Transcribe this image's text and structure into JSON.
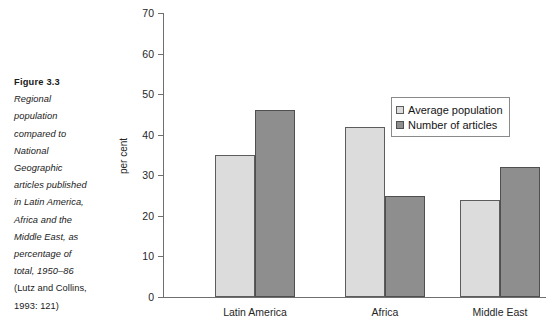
{
  "caption": {
    "title": "Figure 3.3",
    "lines": [
      {
        "text": "Regional",
        "italic": true
      },
      {
        "text": "population",
        "italic": true
      },
      {
        "text": "compared to",
        "italic": true
      },
      {
        "text": "National",
        "italic": true
      },
      {
        "text": "Geographic",
        "italic": true
      },
      {
        "text": "articles published",
        "italic": true
      },
      {
        "text": "in Latin America,",
        "italic": true
      },
      {
        "text": "Africa and the",
        "italic": true
      },
      {
        "text": "Middle East, as",
        "italic": true
      },
      {
        "text": "percentage of",
        "italic": true
      },
      {
        "text": "total, 1950–86",
        "italic": true
      },
      {
        "text": "(Lutz and Collins,",
        "italic": false
      },
      {
        "text": "1993: 121)",
        "italic": false
      }
    ]
  },
  "chart_data": {
    "type": "bar",
    "title": "",
    "xlabel": "",
    "ylabel": "per cent",
    "ylim": [
      0,
      70
    ],
    "ytick_step": 10,
    "yticks": [
      0,
      10,
      20,
      30,
      40,
      50,
      60,
      70
    ],
    "grid": false,
    "legend_position": "upper-right-inside",
    "categories": [
      "Latin America",
      "Africa",
      "Middle East"
    ],
    "series": [
      {
        "name": "Average population",
        "color": "#dcdcdc",
        "values": [
          35,
          42,
          24
        ]
      },
      {
        "name": "Number of articles",
        "color": "#8e8e8e",
        "values": [
          46,
          25,
          32
        ]
      }
    ]
  },
  "colors": {
    "series_light": "#dcdcdc",
    "series_dark": "#8e8e8e",
    "axis": "#6f6f6f",
    "text": "#1a1a1a",
    "background": "#ffffff"
  }
}
